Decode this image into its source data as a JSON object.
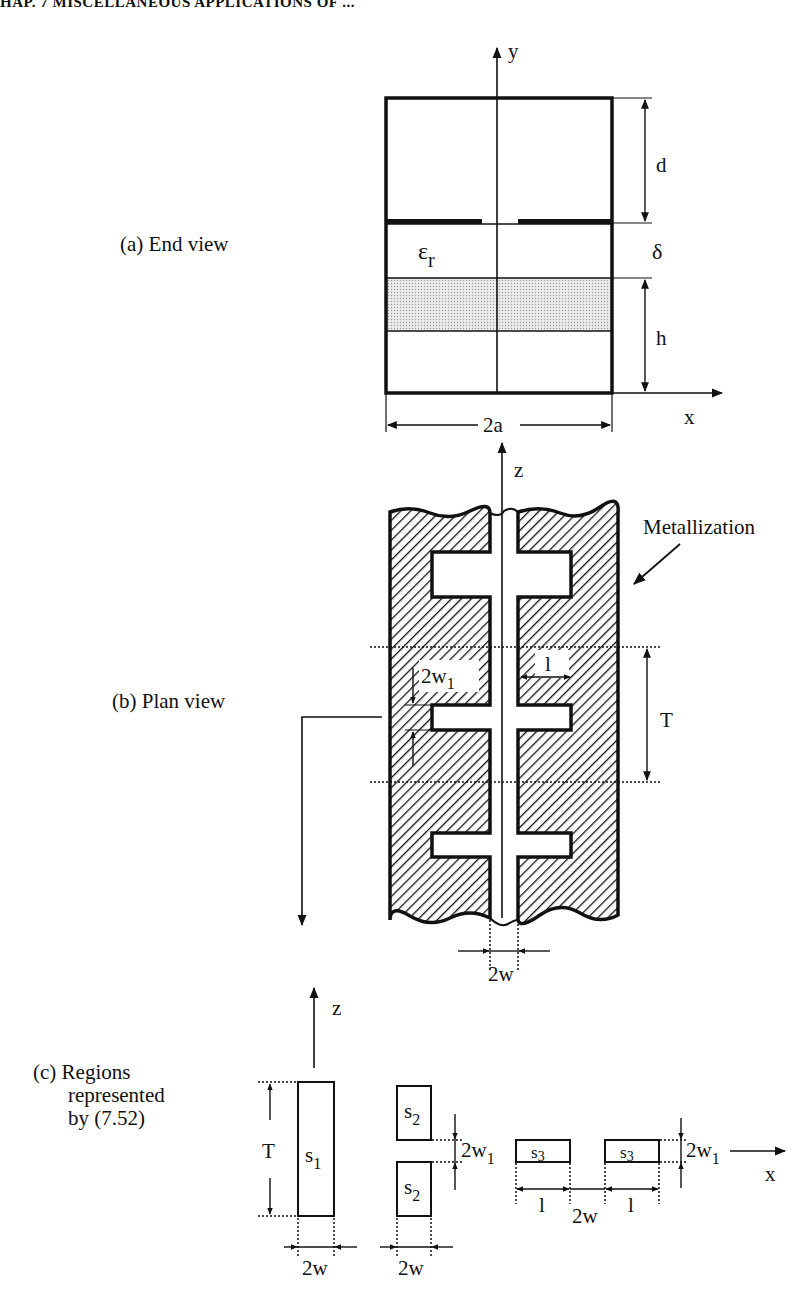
{
  "header": {
    "running_head": "HAP. 7   MISCELLANEOUS APPLICATIONS OF ..."
  },
  "panels": {
    "a": {
      "label": "(a) End view"
    },
    "b": {
      "label": "(b) Plan view"
    },
    "c": {
      "label_lines": [
        "(c) Regions",
        "represented",
        "by (7.52)"
      ]
    }
  },
  "end_view": {
    "axis_y": "y",
    "axis_x": "x",
    "dielectric": "ε",
    "dielectric_sub": "r",
    "dim_top": "d",
    "dim_mid": "δ",
    "dim_bottom": "h",
    "dim_width": "2a"
  },
  "plan_view": {
    "axis_z": "z",
    "metallization": "Metallization",
    "dim_slot_width": "2w",
    "dim_stub_width": "2w",
    "dim_stub_width_sub": "1",
    "dim_stub_length": "l",
    "dim_period": "T"
  },
  "regions": {
    "axis_z": "z",
    "axis_x": "x",
    "s1": "s",
    "s1_sub": "1",
    "s2": "s",
    "s2_sub": "2",
    "s3": "s",
    "s3_sub": "3",
    "dim_T": "T",
    "dim_2w_a": "2w",
    "dim_2w_b": "2w",
    "dim_2w_c": "2w",
    "dim_2w1": "2w",
    "dim_2w1_sub": "1",
    "dim_l": "l"
  }
}
